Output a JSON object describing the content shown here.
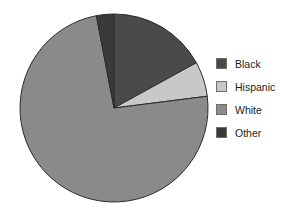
{
  "chart_data": {
    "type": "pie",
    "title": "",
    "subtitle": "",
    "xlabel": "",
    "ylabel": "",
    "legend_position": "right",
    "grid": false,
    "start_angle_deg": 0,
    "direction": "clockwise",
    "categories": [
      "Black",
      "Hispanic",
      "White",
      "Other"
    ],
    "values": [
      17,
      6,
      74,
      3
    ],
    "slices": [
      {
        "label": "Black",
        "value": 17,
        "color": "#4a4a4a"
      },
      {
        "label": "Hispanic",
        "value": 6,
        "color": "#c8c8c8"
      },
      {
        "label": "White",
        "value": 74,
        "color": "#8a8a8a"
      },
      {
        "label": "Other",
        "value": 3,
        "color": "#3a3a3a"
      }
    ]
  },
  "legend": {
    "items": [
      {
        "label": "Black",
        "color": "#4a4a4a"
      },
      {
        "label": "Hispanic",
        "color": "#c8c8c8"
      },
      {
        "label": "White",
        "color": "#8a8a8a"
      },
      {
        "label": "Other",
        "color": "#3a3a3a"
      }
    ]
  },
  "geometry": {
    "cx": 114,
    "cy": 108,
    "r": 94,
    "stroke": "#2b2b2b",
    "stroke_width": 1
  }
}
